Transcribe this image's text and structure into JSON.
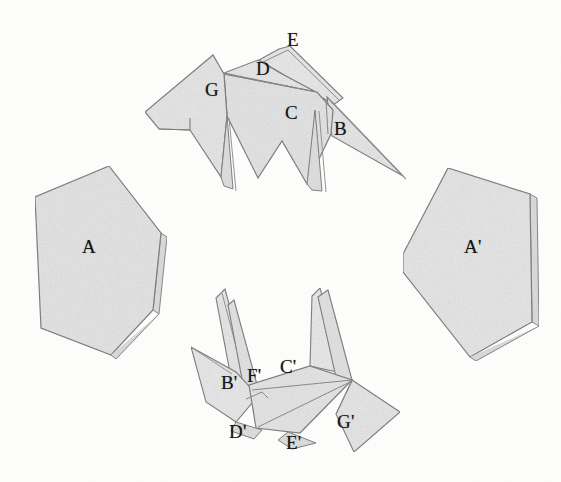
{
  "figure": {
    "background_color": "#fdfdfc",
    "paper_fill": "#e3e3e3",
    "paper_fill_light": "#ececec",
    "paper_fill_dark": "#d4d4d4",
    "edge_color": "#6b6b6b",
    "label_color": "#141414"
  },
  "labels": {
    "pentagon_left": "A",
    "pentagon_right": "A'",
    "top_b": "B",
    "top_c": "C",
    "top_d": "D",
    "top_e": "E",
    "top_g": "G",
    "bottom_b": "B'",
    "bottom_c": "C'",
    "bottom_d": "D'",
    "bottom_e": "E'",
    "bottom_f": "F'",
    "bottom_g": "G'"
  },
  "shapes": {
    "pentagon_left": {
      "name": "pentagon-A",
      "points": "35,197 109,166 161,233 153,310 111,355 41,328",
      "thickness_points": "161,233 166,236 158,313 153,310"
    },
    "pentagon_right": {
      "name": "pentagon-A-prime",
      "points": "448,168 530,194 532,322 514,338 470,355 404,272 403,254"
    },
    "top_form": {
      "name": "origami-top",
      "wing_g": "145,111 212,55 222,116 225,170 215,172 219,125 160,127 146,117",
      "body_c": "220,117 248,68 262,60 318,86 330,120 305,182 283,143 263,178 226,112",
      "flap_d": "248,68 262,60 290,45 316,86 262,74",
      "flap_e": "264,58 294,43 340,96 330,112",
      "flap_b": "330,96 400,170 332,134 331,110",
      "leg_1": "215,172 226,113 230,185 221,178",
      "leg_2": "305,182 314,112 320,190 310,188"
    },
    "bottom_form": {
      "name": "origami-bottom",
      "wing_left": "192,348 243,372 256,392 234,419 206,400",
      "spike_1": "226,292 250,390 236,392 218,296",
      "spike_2": "236,300 256,388 244,394 228,303",
      "spike_c": "322,289 340,374 306,360 314,295",
      "spike_c2": "330,292 348,376 336,380 320,296",
      "body": "256,392 340,374 356,400 300,432 258,426",
      "wing_g": "356,400 398,412 380,446 340,452 348,412",
      "foot_d": "234,419 262,428 252,438 230,430",
      "foot_e": "296,430 312,442 288,446 280,436"
    }
  }
}
